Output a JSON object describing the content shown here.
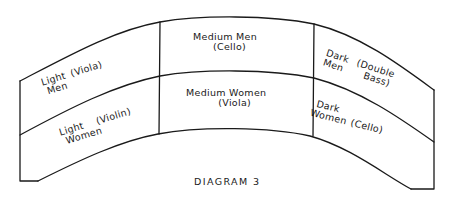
{
  "diagram": {
    "caption": "DIAGRAM 3",
    "line_color": "#1a1a1a",
    "background": "#ffffff",
    "rows": [
      "Men",
      "Women"
    ],
    "columns": [
      "Light",
      "Medium",
      "Dark"
    ],
    "cells": {
      "light_men": {
        "line1": "Light",
        "line2": "Men",
        "instrument": "(Viola)"
      },
      "medium_men": {
        "line1": "Medium Men",
        "line2": "(Cello)"
      },
      "dark_men": {
        "line1": "Dark",
        "line2": "Men",
        "instrument_line1": "(Double",
        "instrument_line2": "Bass)"
      },
      "light_women": {
        "line1": "Light",
        "line2": "Women",
        "instrument": "(Violin)"
      },
      "medium_women": {
        "line1": "Medium Women",
        "line2": "(Viola)"
      },
      "dark_women": {
        "line1": "Dark",
        "line2": "Women",
        "instrument": "(Cello)"
      }
    }
  }
}
